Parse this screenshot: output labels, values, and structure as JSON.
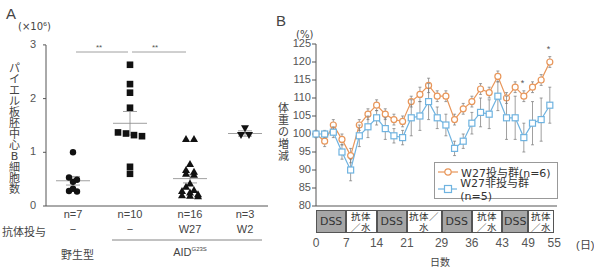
{
  "panel_a": {
    "label": "A",
    "unit": "(×10⁶)",
    "ylabel_chars": [
      "パ",
      "イ",
      "エ",
      "ル",
      "板",
      "胚",
      "中",
      "心",
      "B",
      "細",
      "胞",
      "数"
    ],
    "yticks": [
      "3",
      "2",
      "1",
      "0"
    ],
    "significance": [
      "**",
      "**"
    ],
    "groups": [
      {
        "n": "n=7",
        "antibody": "−"
      },
      {
        "n": "n=10",
        "antibody": "−"
      },
      {
        "n": "n=16",
        "antibody": "W27"
      },
      {
        "n": "n=3",
        "antibody": "W2"
      }
    ],
    "antibody_row_label": "抗体投与",
    "wildtype_label": "野生型",
    "aid_label": "AID",
    "aid_superscript": "G23S"
  },
  "panel_b": {
    "label": "B",
    "unit": "(%)",
    "ylabel_chars": [
      "体",
      "重",
      "の",
      "増",
      "減"
    ],
    "yticks": [
      "125",
      "120",
      "115",
      "110",
      "105",
      "100",
      "95",
      "90",
      "85",
      "80"
    ],
    "xticks": [
      "0",
      "7",
      "14",
      "21",
      "29",
      "36",
      "43",
      "49",
      "55"
    ],
    "x_unit": "(日)",
    "xlabel": "日数",
    "treatment_segments": [
      {
        "label": "DSS",
        "from": 0,
        "to": 7,
        "shaded": true
      },
      {
        "label": "抗体／水",
        "from": 7,
        "to": 14,
        "shaded": false
      },
      {
        "label": "DSS",
        "from": 14,
        "to": 21,
        "shaded": true
      },
      {
        "label": "抗体／水",
        "from": 21,
        "to": 29,
        "shaded": false
      },
      {
        "label": "DSS",
        "from": 29,
        "to": 36,
        "shaded": true
      },
      {
        "label": "抗体／水",
        "from": 36,
        "to": 43,
        "shaded": false
      },
      {
        "label": "DSS",
        "from": 43,
        "to": 49,
        "shaded": true
      },
      {
        "label": "抗体／水",
        "from": 49,
        "to": 55,
        "shaded": false
      }
    ],
    "legend": [
      {
        "label": "W27投与群(n=6)",
        "color": "#e8965a",
        "marker": "circle"
      },
      {
        "label": "W27非投与群(n=5)",
        "color": "#6fb3e0",
        "marker": "square"
      }
    ],
    "significance_marks": [
      "*",
      "*"
    ]
  },
  "chart_data": [
    {
      "type": "scatter",
      "title": "A",
      "xlabel": "",
      "ylabel": "パイエル板胚中心B細胞数 (×10⁶)",
      "ylim": [
        0,
        3
      ],
      "categories": [
        "野生型 (n=7, −)",
        "AID G23S (n=10, −)",
        "AID G23S (n=16, W27)",
        "AID G23S (n=3, W2)"
      ],
      "series": [
        {
          "name": "野生型 n=7",
          "marker": "circle",
          "values": [
            1.0,
            0.53,
            0.49,
            0.45,
            0.32,
            0.28,
            0.27
          ],
          "mean": 0.47
        },
        {
          "name": "AID G23S n=10 −",
          "marker": "square",
          "values": [
            2.63,
            2.27,
            2.11,
            1.83,
            1.37,
            1.35,
            1.32,
            1.3,
            0.73,
            0.6
          ],
          "mean": 1.54
        },
        {
          "name": "AID G23S n=16 W27",
          "marker": "triangle",
          "values": [
            1.25,
            1.25,
            0.78,
            0.67,
            0.64,
            0.6,
            0.58,
            0.42,
            0.36,
            0.3,
            0.28,
            0.25,
            0.22,
            0.2,
            0.19,
            0.18
          ],
          "mean": 0.51
        },
        {
          "name": "AID G23S n=3 W2",
          "marker": "triangle-down",
          "values": [
            1.45,
            1.32,
            1.32
          ],
          "mean": 1.35
        }
      ],
      "annotations": [
        "** (野生型 vs AID−)",
        "** (AID− vs W27)"
      ]
    },
    {
      "type": "line",
      "title": "B",
      "xlabel": "日数",
      "ylabel": "体重の増減 (%)",
      "ylim": [
        80,
        125
      ],
      "xlim": [
        0,
        55
      ],
      "x": [
        0,
        2,
        4,
        6,
        8,
        10,
        12,
        14,
        16,
        18,
        20,
        22,
        24,
        26,
        28,
        30,
        32,
        34,
        36,
        38,
        40,
        42,
        44,
        46,
        48,
        50,
        52,
        54
      ],
      "series": [
        {
          "name": "W27投与群(n=6)",
          "color": "#e8965a",
          "values": [
            100,
            98,
            102.5,
            98.5,
            94,
            102.5,
            105.5,
            108,
            105.5,
            104,
            103.5,
            109,
            111,
            113.5,
            110.5,
            110.5,
            104,
            107,
            109,
            112.5,
            111.5,
            116,
            110,
            113,
            110.5,
            113,
            115,
            120
          ]
        },
        {
          "name": "W27非投与群(n=5)",
          "color": "#6fb3e0",
          "values": [
            100,
            100,
            100.5,
            95,
            90,
            99.5,
            102,
            104.5,
            101.5,
            99.5,
            99,
            104.5,
            105,
            109,
            104.5,
            102.5,
            96,
            98,
            103,
            106,
            105.5,
            110.5,
            104.5,
            104.5,
            99,
            103,
            104,
            108
          ]
        }
      ],
      "annotations": [
        "* at day 48",
        "* at day 54"
      ],
      "legend_position": "lower right"
    }
  ]
}
